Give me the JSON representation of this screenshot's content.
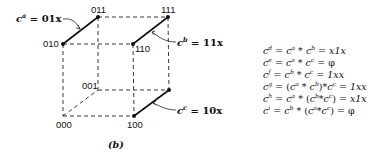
{
  "diagram": {
    "type": "boolean-cube",
    "caption": "(b)",
    "vertices": [
      {
        "id": "000",
        "label": "000",
        "x": 63,
        "y": 116
      },
      {
        "id": "001",
        "label": "001",
        "x": 98,
        "y": 90
      },
      {
        "id": "010",
        "label": "010",
        "x": 63,
        "y": 44
      },
      {
        "id": "011",
        "label": "011",
        "x": 98,
        "y": 17
      },
      {
        "id": "100",
        "label": "100",
        "x": 134,
        "y": 116
      },
      {
        "id": "101",
        "label": "101",
        "x": 169,
        "y": 90
      },
      {
        "id": "110",
        "label": "110",
        "x": 133,
        "y": 44
      },
      {
        "id": "111",
        "label": "111",
        "x": 168,
        "y": 17
      }
    ],
    "cubes": [
      {
        "name": "c",
        "sup": "a",
        "value": "01x",
        "edge": [
          "010",
          "011"
        ]
      },
      {
        "name": "c",
        "sup": "b",
        "value": "11x",
        "edge": [
          "110",
          "111"
        ]
      },
      {
        "name": "c",
        "sup": "c",
        "value": "10x",
        "edge": [
          "100",
          "101"
        ]
      }
    ],
    "labels": {
      "ca": {
        "base": "c",
        "sup": "a",
        "rhs": " = 01x"
      },
      "cb": {
        "base": "c",
        "sup": "b",
        "rhs": " = 11x"
      },
      "cc": {
        "base": "c",
        "sup": "c",
        "rhs": " = 10x"
      }
    }
  },
  "equations": [
    {
      "lhs_sup": "d",
      "expr_html": [
        "c",
        "a",
        " * ",
        "c",
        "b",
        ""
      ],
      "text": "c^d = c^a * c^b = x1x",
      "result": "x1x"
    },
    {
      "lhs_sup": "e",
      "text": "c^e = c^a * c^c = φ",
      "result": "φ"
    },
    {
      "lhs_sup": "f",
      "text": "c^f = c^b * c^c = 1xx",
      "result": "1xx"
    },
    {
      "lhs_sup": "g",
      "text": "c^g = (c^a * c^b)*c^c = 1xx",
      "result": "1xx"
    },
    {
      "lhs_sup": "h",
      "text": "c^h = c^a * (c^b*c^c) = x1x",
      "result": "x1x"
    },
    {
      "lhs_sup": "i",
      "text": "c^i = c^b * (c^a*c^c) = φ",
      "result": "φ"
    }
  ],
  "eq_parts": {
    "d": {
      "l": "d",
      "p1": "a",
      "p2": "b",
      "r": "x1x"
    },
    "e": {
      "l": "e",
      "p1": "a",
      "p2": "c",
      "r": "φ"
    },
    "f": {
      "l": "f",
      "p1": "b",
      "p2": "c",
      "r": "1xx"
    },
    "g": {
      "l": "g",
      "p1": "a",
      "p2": "b",
      "p3": "c",
      "r": "1xx"
    },
    "h": {
      "l": "h",
      "p1": "a",
      "p2": "b",
      "p3": "c",
      "r": "x1x"
    },
    "i": {
      "l": "i",
      "p1": "b",
      "p2": "a",
      "p3": "c",
      "r": "φ"
    }
  },
  "symbols": {
    "c": "c",
    "eq": " = ",
    "star": " * ",
    "star_tight": "*",
    "lp": "(",
    "rp": ")"
  }
}
